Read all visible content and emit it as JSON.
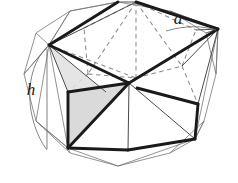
{
  "figure": {
    "background_color": "#ffffff",
    "ink_color": "#1a1a1a",
    "hidden_edge_color": "#8c8c8c",
    "thin_edge_color": "#6e6e6e",
    "shade_fill": "#d9d9d9",
    "labels": [
      {
        "id": "edge-label-a",
        "text": "a",
        "x": 178,
        "y": 24,
        "size": 17
      },
      {
        "id": "height-label-h",
        "text": "h",
        "x": 30,
        "y": 95,
        "size": 17
      }
    ],
    "geometry": {
      "outer_frame": {
        "name": "outer-polygon",
        "points": "118,2 170,11 206,33 216,74 204,121 170,153 118,166 70,153 36,121 24,74 36,33 70,11"
      },
      "top_vertex": {
        "x": 136,
        "y": 2
      },
      "left_vertex": {
        "x": 49,
        "y": 45
      },
      "right_vertex": {
        "x": 218,
        "y": 29
      },
      "center_vertex": {
        "x": 129,
        "y": 83
      },
      "bottom_left_vertex": {
        "x": 68,
        "y": 148
      },
      "bottom_right_vertex": {
        "x": 195,
        "y": 139
      },
      "height_line": {
        "x1": 47,
        "y1": 49,
        "x2": 47,
        "y2": 149
      },
      "height_arc": "M 47,47 C 22,70 26,120 47,150",
      "edge_arc": "M 168,29 C 186,27 204,30 216,30"
    }
  }
}
